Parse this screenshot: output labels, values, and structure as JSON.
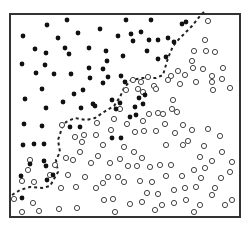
{
  "chart_data": {
    "type": "scatter",
    "title": "",
    "xlabel": "",
    "ylabel": "",
    "grid": false,
    "legend": null,
    "frame": {
      "x": 10,
      "y": 14,
      "width": 230,
      "height": 203
    },
    "colors": {
      "frame": "#333333",
      "filled": "#111111",
      "open_stroke": "#444444",
      "boundary": "#222222"
    },
    "series": [
      {
        "name": "class-filled",
        "marker": "filled-circle",
        "points": [
          [
            47,
            25
          ],
          [
            67,
            20
          ],
          [
            23,
            36
          ],
          [
            58,
            38
          ],
          [
            78,
            33
          ],
          [
            100,
            29
          ],
          [
            118,
            36
          ],
          [
            35,
            49
          ],
          [
            46,
            53
          ],
          [
            65,
            48
          ],
          [
            69,
            54
          ],
          [
            89,
            48
          ],
          [
            106,
            51
          ],
          [
            123,
            56
          ],
          [
            22,
            64
          ],
          [
            45,
            65
          ],
          [
            36,
            73
          ],
          [
            54,
            74
          ],
          [
            71,
            74
          ],
          [
            90,
            78
          ],
          [
            103,
            69
          ],
          [
            121,
            76
          ],
          [
            103,
            83
          ],
          [
            42,
            89
          ],
          [
            74,
            94
          ],
          [
            83,
            90
          ],
          [
            25,
            99
          ],
          [
            63,
            102
          ],
          [
            93,
            104
          ],
          [
            112,
            100
          ],
          [
            46,
            108
          ],
          [
            81,
            108
          ],
          [
            116,
            109
          ],
          [
            126,
            20
          ],
          [
            151,
            20
          ],
          [
            131,
            34
          ],
          [
            141,
            32
          ],
          [
            133,
            41
          ],
          [
            149,
            40
          ],
          [
            158,
            40
          ],
          [
            168,
            38
          ],
          [
            182,
            24
          ],
          [
            158,
            59
          ],
          [
            166,
            57
          ],
          [
            107,
            61
          ],
          [
            89,
            68
          ],
          [
            147,
            51
          ],
          [
            186,
            22
          ],
          [
            174,
            42
          ],
          [
            145,
            95
          ],
          [
            136,
            115
          ],
          [
            139,
            98
          ],
          [
            135,
            107
          ],
          [
            108,
            77
          ],
          [
            125,
            82
          ],
          [
            120,
            103
          ],
          [
            130,
            117
          ],
          [
            24,
            124
          ],
          [
            42,
            126
          ],
          [
            70,
            127
          ],
          [
            80,
            127
          ],
          [
            95,
            106
          ],
          [
            112,
            138
          ],
          [
            121,
            138
          ],
          [
            143,
            104
          ],
          [
            23,
            145
          ],
          [
            44,
            144
          ],
          [
            34,
            144
          ],
          [
            44,
            161
          ],
          [
            30,
            164
          ],
          [
            46,
            166
          ],
          [
            53,
            175
          ],
          [
            21,
            176
          ],
          [
            47,
            180
          ],
          [
            22,
            198
          ]
        ]
      },
      {
        "name": "class-open",
        "marker": "open-circle",
        "points": [
          [
            208,
            21
          ],
          [
            194,
            51
          ],
          [
            205,
            40
          ],
          [
            206,
            51
          ],
          [
            215,
            52
          ],
          [
            193,
            68
          ],
          [
            203,
            69
          ],
          [
            178,
            71
          ],
          [
            192,
            61
          ],
          [
            223,
            68
          ],
          [
            196,
            82
          ],
          [
            212,
            82
          ],
          [
            213,
            90
          ],
          [
            222,
            79
          ],
          [
            230,
            88
          ],
          [
            212,
            76
          ],
          [
            180,
            84
          ],
          [
            171,
            76
          ],
          [
            168,
            80
          ],
          [
            185,
            75
          ],
          [
            173,
            100
          ],
          [
            163,
            114
          ],
          [
            177,
            112
          ],
          [
            172,
            109
          ],
          [
            158,
            113
          ],
          [
            165,
            124
          ],
          [
            183,
            125
          ],
          [
            143,
            121
          ],
          [
            149,
            114
          ],
          [
            154,
            86
          ],
          [
            156,
            89
          ],
          [
            148,
            77
          ],
          [
            138,
            89
          ],
          [
            143,
            92
          ],
          [
            126,
            90
          ],
          [
            133,
            80
          ],
          [
            141,
            82
          ],
          [
            135,
            132
          ],
          [
            144,
            131
          ],
          [
            156,
            131
          ],
          [
            166,
            145
          ],
          [
            175,
            133
          ],
          [
            183,
            145
          ],
          [
            188,
            141
          ],
          [
            192,
            130
          ],
          [
            204,
            146
          ],
          [
            208,
            129
          ],
          [
            220,
            136
          ],
          [
            200,
            157
          ],
          [
            212,
            161
          ],
          [
            222,
            152
          ],
          [
            205,
            168
          ],
          [
            232,
            162
          ],
          [
            215,
            188
          ],
          [
            221,
            178
          ],
          [
            230,
            172
          ],
          [
            196,
            187
          ],
          [
            212,
            195
          ],
          [
            96,
            135
          ],
          [
            111,
            130
          ],
          [
            114,
            119
          ],
          [
            120,
            109
          ],
          [
            127,
            124
          ],
          [
            97,
            123
          ],
          [
            82,
            142
          ],
          [
            103,
            145
          ],
          [
            98,
            156
          ],
          [
            91,
            163
          ],
          [
            73,
            160
          ],
          [
            85,
            177
          ],
          [
            68,
            175
          ],
          [
            61,
            188
          ],
          [
            76,
            187
          ],
          [
            96,
            188
          ],
          [
            103,
            183
          ],
          [
            108,
            177
          ],
          [
            118,
            177
          ],
          [
            124,
            182
          ],
          [
            140,
            181
          ],
          [
            147,
            193
          ],
          [
            158,
            194
          ],
          [
            174,
            190
          ],
          [
            185,
            188
          ],
          [
            62,
            125
          ],
          [
            75,
            137
          ],
          [
            84,
            135
          ],
          [
            124,
            147
          ],
          [
            134,
            152
          ],
          [
            142,
            158
          ],
          [
            150,
            167
          ],
          [
            160,
            165
          ],
          [
            166,
            176
          ],
          [
            182,
            176
          ],
          [
            194,
            170
          ],
          [
            201,
            178
          ],
          [
            30,
            160
          ],
          [
            55,
            165
          ],
          [
            66,
            158
          ],
          [
            80,
            152
          ],
          [
            110,
            163
          ],
          [
            120,
            159
          ],
          [
            128,
            166
          ],
          [
            137,
            166
          ],
          [
            152,
            182
          ],
          [
            171,
            165
          ],
          [
            28,
            170
          ],
          [
            34,
            182
          ],
          [
            50,
            175
          ],
          [
            22,
            181
          ],
          [
            14,
            199
          ],
          [
            22,
            212
          ],
          [
            33,
            203
          ],
          [
            39,
            211
          ],
          [
            59,
            209
          ],
          [
            77,
            208
          ],
          [
            104,
            200
          ],
          [
            113,
            199
          ],
          [
            115,
            212
          ],
          [
            130,
            204
          ],
          [
            142,
            202
          ],
          [
            155,
            210
          ],
          [
            162,
            205
          ],
          [
            174,
            203
          ],
          [
            186,
            200
          ],
          [
            194,
            212
          ],
          [
            200,
            205
          ],
          [
            225,
            205
          ],
          [
            232,
            200
          ]
        ]
      }
    ],
    "boundary": {
      "style": "dashed",
      "points": [
        [
          12,
          195
        ],
        [
          20,
          190
        ],
        [
          30,
          187
        ],
        [
          42,
          188
        ],
        [
          50,
          186
        ],
        [
          58,
          172
        ],
        [
          56,
          160
        ],
        [
          60,
          152
        ],
        [
          58,
          140
        ],
        [
          62,
          128
        ],
        [
          66,
          122
        ],
        [
          75,
          118
        ],
        [
          86,
          120
        ],
        [
          95,
          118
        ],
        [
          107,
          110
        ],
        [
          114,
          106
        ],
        [
          120,
          97
        ],
        [
          124,
          88
        ],
        [
          131,
          80
        ],
        [
          142,
          78
        ],
        [
          156,
          78
        ],
        [
          163,
          75
        ],
        [
          168,
          58
        ],
        [
          173,
          46
        ],
        [
          180,
          38
        ],
        [
          192,
          26
        ],
        [
          200,
          16
        ],
        [
          204,
          12
        ]
      ]
    }
  }
}
